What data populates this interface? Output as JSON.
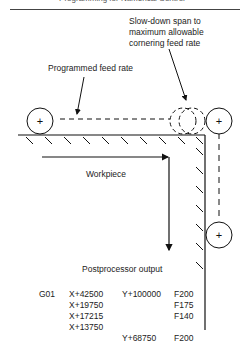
{
  "header": {
    "title": "Programming for Numerical Control"
  },
  "labels": {
    "slowdown_line1": "Slow-down span to",
    "slowdown_line2": "maximum allowable",
    "slowdown_line3": "cornering feed rate",
    "programmed_feed_rate": "Programmed feed rate",
    "workpiece": "Workpiece",
    "postprocessor_output": "Postprocessor output"
  },
  "postprocessor": {
    "rows": [
      {
        "g": "G01",
        "x": "X+42500",
        "y": "Y+100000",
        "f": "F200"
      },
      {
        "g": "",
        "x": "X+19750",
        "y": "",
        "f": "F175"
      },
      {
        "g": "",
        "x": "X+17215",
        "y": "",
        "f": "F140"
      },
      {
        "g": "",
        "x": "X+13750",
        "y": "",
        "f": ""
      },
      {
        "g": "",
        "x": "",
        "y": "Y+68750",
        "f": "F200"
      }
    ]
  },
  "symbols": {
    "cutter_center": "+"
  }
}
